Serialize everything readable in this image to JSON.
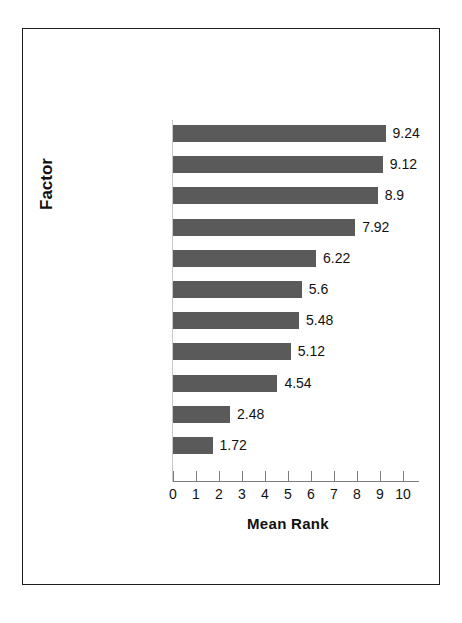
{
  "chart_data": {
    "type": "bar",
    "orientation": "horizontal",
    "title": "",
    "xlabel": "Mean Rank",
    "ylabel": "Factor",
    "xlim": [
      0,
      10
    ],
    "xticks": [
      "0",
      "1",
      "2",
      "3",
      "4",
      "5",
      "6",
      "7",
      "8",
      "9",
      "10"
    ],
    "grid": false,
    "legend": null,
    "bar_color": "#5a5a5a",
    "categories": [
      "Prosecutor Input",
      "Inmate Demeanor",
      "Judge Input",
      "Victim Input",
      "Previous Probation\nAdjustment",
      "Psychological Report",
      "Program Participation",
      "Disciplinary Record",
      "Previous Parole\nAdjustment",
      "Prior Criminal Record",
      "Nature of Presenting\nOffense"
    ],
    "values": [
      9.24,
      9.12,
      8.9,
      7.92,
      6.22,
      5.6,
      5.48,
      5.12,
      4.54,
      2.48,
      1.72
    ],
    "value_labels": [
      "9.24",
      "9.12",
      "8.9",
      "7.92",
      "6.22",
      "5.6",
      "5.48",
      "5.12",
      "4.54",
      "2.48",
      "1.72"
    ]
  }
}
